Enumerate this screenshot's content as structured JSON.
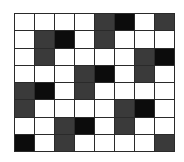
{
  "grid": {
    "rows": 8,
    "cols": 8,
    "legend": {
      "W": "white",
      "D": "dark gray",
      "B": "black"
    },
    "colors": {
      "W": "#ffffff",
      "D": "#3a3a3a",
      "B": "#0c0c0c",
      "line": "#2a2a2a"
    },
    "cells": [
      [
        "W",
        "W",
        "W",
        "W",
        "D",
        "B",
        "W",
        "D"
      ],
      [
        "W",
        "D",
        "B",
        "W",
        "D",
        "W",
        "W",
        "W"
      ],
      [
        "W",
        "D",
        "W",
        "W",
        "W",
        "W",
        "D",
        "B"
      ],
      [
        "W",
        "W",
        "W",
        "D",
        "B",
        "W",
        "D",
        "W"
      ],
      [
        "D",
        "B",
        "W",
        "D",
        "W",
        "W",
        "W",
        "W"
      ],
      [
        "D",
        "W",
        "W",
        "W",
        "W",
        "D",
        "B",
        "W"
      ],
      [
        "W",
        "W",
        "D",
        "B",
        "W",
        "D",
        "W",
        "W"
      ],
      [
        "B",
        "W",
        "D",
        "W",
        "W",
        "W",
        "W",
        "D"
      ]
    ]
  }
}
